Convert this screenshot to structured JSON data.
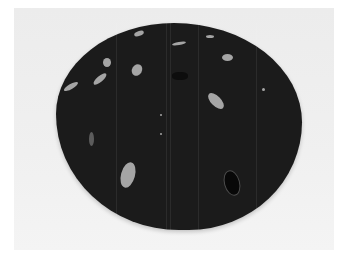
{
  "image": {
    "description": "Photograph of a dark rounded stone slice with scattered light leaf-shaped inclusions on a pale background",
    "colors": {
      "background": "#f0f0f0",
      "stone": "#1b1b1b",
      "inclusion": "#bdbdbd"
    }
  }
}
